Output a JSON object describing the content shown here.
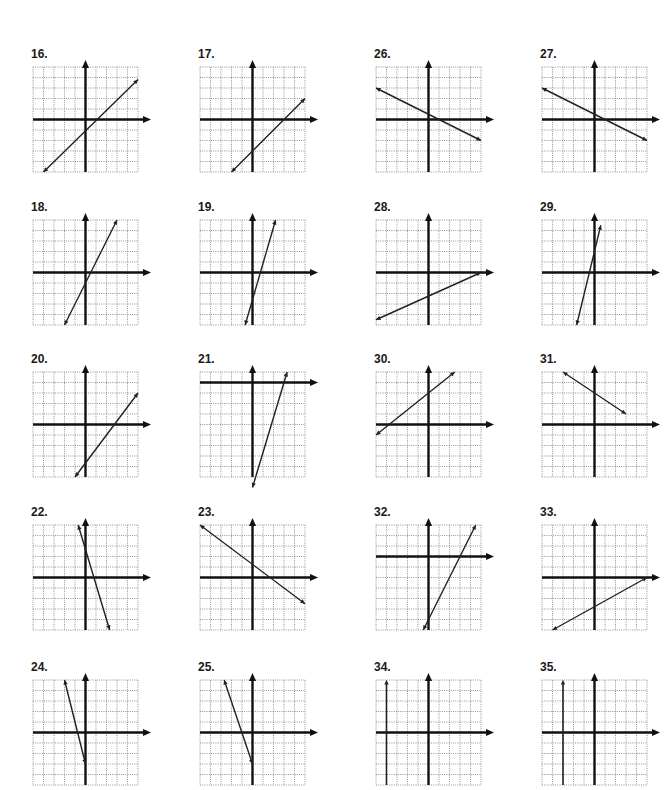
{
  "page": {
    "colors": {
      "grid": "#7a7a7a",
      "axis": "#111111",
      "line": "#222222",
      "label": "#1a1a1a"
    }
  },
  "grid_spec": {
    "cells": 10,
    "cell_px": 10.5,
    "note": "each graph 10x10 unit grid; coordinates given as (col,row) from top-left of grid, axes as gridline indices"
  },
  "problems": [
    {
      "number": "16.",
      "left": 33,
      "top": 47,
      "x_axis_row": 5,
      "y_axis_col": 5,
      "line": [
        [
          1,
          10
        ],
        [
          10,
          1.2
        ]
      ],
      "arrows": "both"
    },
    {
      "number": "17.",
      "left": 200,
      "top": 47,
      "x_axis_row": 5,
      "y_axis_col": 5,
      "line": [
        [
          3,
          10
        ],
        [
          10,
          3
        ]
      ],
      "arrows": "both"
    },
    {
      "number": "26.",
      "left": 376,
      "top": 47,
      "x_axis_row": 5,
      "y_axis_col": 5,
      "line": [
        [
          0,
          2
        ],
        [
          10,
          7
        ]
      ],
      "arrows": "both"
    },
    {
      "number": "27.",
      "left": 542,
      "top": 47,
      "x_axis_row": 5,
      "y_axis_col": 5,
      "line": [
        [
          0,
          2
        ],
        [
          10,
          7
        ]
      ],
      "arrows": "both"
    },
    {
      "number": "18.",
      "left": 33,
      "top": 200,
      "x_axis_row": 5,
      "y_axis_col": 5,
      "line": [
        [
          3,
          10
        ],
        [
          8,
          0
        ]
      ],
      "arrows": "both"
    },
    {
      "number": "19.",
      "left": 200,
      "top": 200,
      "x_axis_row": 5,
      "y_axis_col": 5,
      "line": [
        [
          4.3,
          10
        ],
        [
          7.2,
          0
        ]
      ],
      "arrows": "both"
    },
    {
      "number": "28.",
      "left": 376,
      "top": 200,
      "x_axis_row": 5,
      "y_axis_col": 5,
      "line": [
        [
          0,
          9.5
        ],
        [
          10,
          5
        ]
      ],
      "arrows": "both"
    },
    {
      "number": "29.",
      "left": 542,
      "top": 200,
      "x_axis_row": 5,
      "y_axis_col": 5,
      "line": [
        [
          3.3,
          10
        ],
        [
          5.6,
          0.5
        ]
      ],
      "arrows": "both"
    },
    {
      "number": "20.",
      "left": 33,
      "top": 352,
      "x_axis_row": 5,
      "y_axis_col": 5,
      "line": [
        [
          4,
          10
        ],
        [
          10,
          2
        ]
      ],
      "arrows": "both"
    },
    {
      "number": "21.",
      "left": 200,
      "top": 352,
      "x_axis_row": 1,
      "y_axis_col": 5,
      "line": [
        [
          5,
          11
        ],
        [
          8.3,
          0
        ]
      ],
      "arrows": "both"
    },
    {
      "number": "30.",
      "left": 376,
      "top": 352,
      "x_axis_row": 5,
      "y_axis_col": 5,
      "line": [
        [
          0,
          6
        ],
        [
          7.5,
          0
        ]
      ],
      "arrows": "both"
    },
    {
      "number": "31.",
      "left": 542,
      "top": 352,
      "x_axis_row": 5,
      "y_axis_col": 5,
      "line": [
        [
          2,
          0
        ],
        [
          8,
          4
        ]
      ],
      "arrows": "both"
    },
    {
      "number": "22.",
      "left": 33,
      "top": 505,
      "x_axis_row": 5,
      "y_axis_col": 5,
      "line": [
        [
          4.3,
          0
        ],
        [
          7.3,
          10
        ]
      ],
      "arrows": "both"
    },
    {
      "number": "23.",
      "left": 200,
      "top": 505,
      "x_axis_row": 5,
      "y_axis_col": 5,
      "line": [
        [
          0,
          0
        ],
        [
          10,
          7.5
        ]
      ],
      "arrows": "both"
    },
    {
      "number": "32.",
      "left": 376,
      "top": 505,
      "x_axis_row": 3,
      "y_axis_col": 5,
      "line": [
        [
          4.5,
          10
        ],
        [
          9.5,
          0
        ]
      ],
      "arrows": "both"
    },
    {
      "number": "33.",
      "left": 542,
      "top": 505,
      "x_axis_row": 5,
      "y_axis_col": 5,
      "line": [
        [
          1,
          10
        ],
        [
          10,
          5
        ]
      ],
      "arrows": "both"
    },
    {
      "number": "24.",
      "left": 33,
      "top": 660,
      "x_axis_row": 5,
      "y_axis_col": 5,
      "line": [
        [
          3,
          0
        ],
        [
          5,
          8
        ]
      ],
      "arrows": "both"
    },
    {
      "number": "25.",
      "left": 200,
      "top": 660,
      "x_axis_row": 5,
      "y_axis_col": 5,
      "line": [
        [
          2.3,
          0
        ],
        [
          5,
          8
        ]
      ],
      "arrows": "both"
    },
    {
      "number": "34.",
      "left": 376,
      "top": 660,
      "x_axis_row": 5,
      "y_axis_col": 5,
      "vertical_line_col": 1,
      "arrows": "up"
    },
    {
      "number": "35.",
      "left": 542,
      "top": 660,
      "x_axis_row": 5,
      "y_axis_col": 5,
      "vertical_line_col": 2,
      "arrows": "up"
    }
  ]
}
